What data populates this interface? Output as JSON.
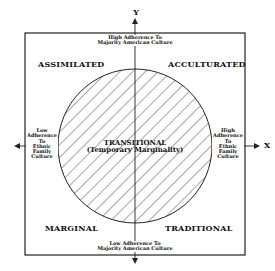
{
  "diagram": {
    "title": "",
    "axes": {
      "y_label": "Y",
      "x_label": "X",
      "top": "High Adherence To Majority American Culture",
      "bottom": "Low Adherence To Majority American Culture",
      "left": [
        "Low",
        "Adherence",
        "To",
        "Ethnic",
        "Family",
        "Culture"
      ],
      "right": [
        "High",
        "Adherence",
        "To",
        "Ethnic",
        "Family",
        "Culture"
      ]
    },
    "quadrants": {
      "top_left": "ASSIMILATED",
      "top_right": "ACCULTURATED",
      "bottom_left": "MARGINAL",
      "bottom_right": "TRADITIONAL"
    },
    "center": {
      "line1": "TRANSITIONAL",
      "line2": "(Temporary Marginality)"
    },
    "top_lines": [
      "High Adherence To",
      "Majority American Culture"
    ],
    "bottom_lines": [
      "Low Adherence To",
      "Majority American Culture"
    ]
  }
}
